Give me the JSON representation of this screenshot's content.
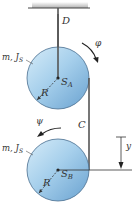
{
  "diagram": {
    "labels": {
      "rope_top": "D",
      "rope_mid": "C",
      "disk_a_props": "m, J",
      "disk_a_props_sub": "S",
      "disk_a_center": "S",
      "disk_a_center_sub": "A",
      "disk_a_radius": "R",
      "disk_b_props": "m, J",
      "disk_b_props_sub": "S",
      "disk_b_center": "S",
      "disk_b_center_sub": "B",
      "disk_b_radius": "R",
      "angle_a": "φ",
      "angle_b": "ψ",
      "displacement": "y"
    },
    "colors": {
      "disk_light": "#dbeefa",
      "disk_mid": "#9fcbe9",
      "disk_dark": "#6fa6d2",
      "disk_edge": "#4a6f8f",
      "rope": "#555555",
      "line": "#333333",
      "ceiling_shade": "#b8b8b8"
    }
  }
}
